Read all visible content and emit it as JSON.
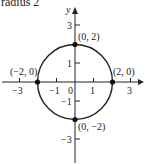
{
  "caption": "radius 2",
  "axes": {
    "x_label": "x",
    "y_label": "y",
    "x_ticks": [
      "−3",
      "−1",
      "0",
      "1",
      "3"
    ],
    "y_ticks": [
      "3",
      "1",
      "−1",
      "−3"
    ]
  },
  "points": [
    {
      "label": "(0, 2)",
      "x": 0,
      "y": 2
    },
    {
      "label": "(−2, 0)",
      "x": -2,
      "y": 0
    },
    {
      "label": "(2, 0)",
      "x": 2,
      "y": 0
    },
    {
      "label": "(0, −2)",
      "x": 0,
      "y": -2
    }
  ],
  "circle": {
    "center": [
      0,
      0
    ],
    "radius": 2
  },
  "colors": {
    "stroke": "#222222",
    "background": "#ffffff"
  }
}
